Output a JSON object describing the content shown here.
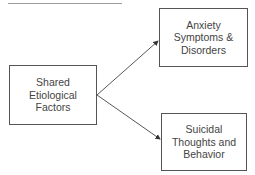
{
  "diagram": {
    "nodes": [
      {
        "id": "shared",
        "label": "Shared\nEtiological\nFactors"
      },
      {
        "id": "anxiety",
        "label": "Anxiety\nSymptoms &\nDisorders"
      },
      {
        "id": "suicidal",
        "label": "Suicidal\nThoughts and\nBehavior"
      }
    ],
    "edges": [
      {
        "from": "shared",
        "to": "anxiety"
      },
      {
        "from": "shared",
        "to": "suicidal"
      }
    ]
  }
}
